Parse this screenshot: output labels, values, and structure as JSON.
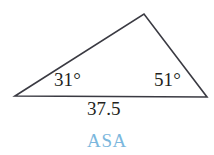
{
  "figure": {
    "type": "triangle-diagram",
    "background_color": "#ffffff",
    "stroke_color": "#3a3a42",
    "text_color": "#231f20",
    "accent_color": "#7bb7dd",
    "angle_a": "31°",
    "angle_b": "51°",
    "side_length": "37.5",
    "congruence_criterion": "ASA",
    "vertices": {
      "left": {
        "x": 15,
        "y": 96
      },
      "apex": {
        "x": 144,
        "y": 14
      },
      "right": {
        "x": 207,
        "y": 97
      }
    }
  },
  "chart_data": {
    "type": "diagram",
    "title": "ASA",
    "shape": "triangle",
    "labels": {
      "angle_left": "31°",
      "angle_right": "51°",
      "base": "37.5",
      "caption": "ASA"
    },
    "values": {
      "angle_left_deg": 31,
      "angle_right_deg": 51,
      "angle_apex_deg": 98,
      "base_length": 37.5
    },
    "points": [
      {
        "name": "left-vertex",
        "x": 15,
        "y": 96
      },
      {
        "name": "apex-vertex",
        "x": 144,
        "y": 14
      },
      {
        "name": "right-vertex",
        "x": 207,
        "y": 97
      }
    ]
  }
}
